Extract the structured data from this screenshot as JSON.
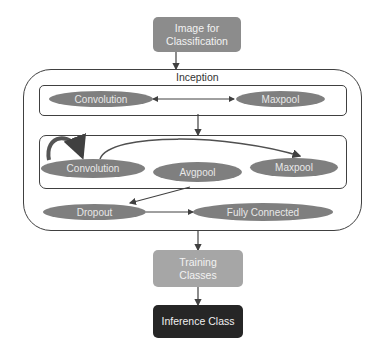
{
  "diagram": {
    "input_node": "Image for Classification",
    "input_node_lines": [
      "Image for",
      "Classification"
    ],
    "group_label": "Inception",
    "row1": {
      "left": "Convolution",
      "right": "Maxpool"
    },
    "row2": {
      "left": "Convolution",
      "middle": "Avgpool",
      "right": "Maxpool"
    },
    "row3": {
      "left": "Dropout",
      "right": "Fully Connected"
    },
    "training_node_lines": [
      "Training",
      "Classes"
    ],
    "output_node": "Inference Class"
  },
  "colors": {
    "node_gray": "#8c8c8c",
    "training_gray": "#a6a6a6",
    "output_dark": "#262626",
    "ellipse": "#7f7f7f",
    "line": "#404040"
  }
}
